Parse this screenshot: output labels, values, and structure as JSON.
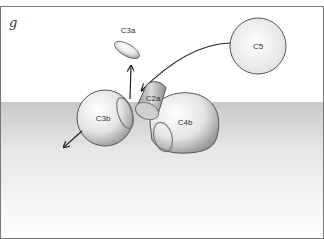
{
  "panel_label": "g",
  "molecules": {
    "c3a": "C3a",
    "c5": "C5",
    "c2a": "C2a",
    "c3b": "C3b",
    "c4b": "C4b"
  },
  "colors": {
    "membrane_top": "#c8c8c8",
    "membrane_bottom": "#ffffff",
    "outline": "#555555",
    "arrow": "#222222"
  }
}
